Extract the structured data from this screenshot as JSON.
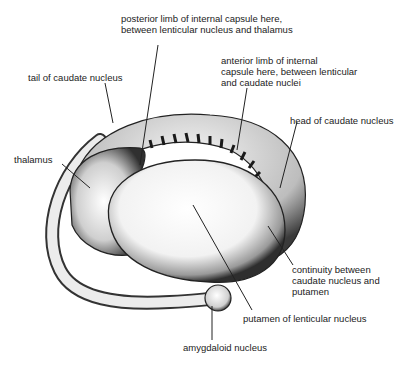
{
  "diagram": {
    "labels": {
      "posterior_limb_1": "posterior limb of internal capsule here,",
      "posterior_limb_2": "between lenticular nucleus and thalamus",
      "tail": "tail of caudate nucleus",
      "anterior_limb_1": "anterior limb of internal",
      "anterior_limb_2": "capsule here, between lenticular",
      "anterior_limb_3": "and caudate nuclei",
      "head": "head of caudate nucleus",
      "thalamus": "thalamus",
      "continuity_1": "continuity between",
      "continuity_2": "caudate nucleus and",
      "continuity_3": "putamen",
      "putamen": "putamen of lenticular nucleus",
      "amygdaloid": "amygdaloid nucleus"
    },
    "colors": {
      "ink": "#222222",
      "shade": "#555555",
      "paper": "#ffffff"
    }
  }
}
